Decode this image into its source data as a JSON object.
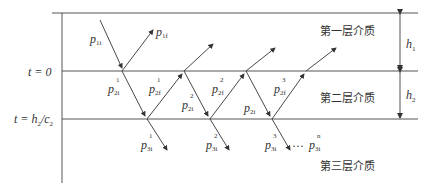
{
  "diagram": {
    "layers": [
      {
        "label": "第一层介质",
        "thickness_label": "h",
        "thickness_sub": "1"
      },
      {
        "label": "第二层介质",
        "thickness_label": "h",
        "thickness_sub": "2"
      },
      {
        "label": "第三层介质"
      }
    ],
    "time_labels": {
      "t0": "t = 0",
      "t1_prefix": "t = h",
      "t1_sub1": "2",
      "t1_mid": "/c",
      "t1_sub2": "2"
    },
    "waves": {
      "p1i": {
        "base": "p",
        "sub": "1i"
      },
      "p1f": {
        "base": "p",
        "sub": "1f"
      },
      "p2i_1": {
        "base": "p",
        "sup": "1",
        "sub": "2i"
      },
      "p2f_1": {
        "base": "p",
        "sup": "1",
        "sub": "2f"
      },
      "p2i_2": {
        "base": "p",
        "sup": "2",
        "sub": "2i"
      },
      "p2f_2": {
        "base": "p",
        "sup": "2",
        "sub": "2f"
      },
      "p2i": {
        "base": "p",
        "sub": "2i"
      },
      "p2f_3": {
        "base": "p",
        "sup": "3",
        "sub": "2f"
      },
      "p3i_1": {
        "base": "p",
        "sup": "1",
        "sub": "3i"
      },
      "p3i_2": {
        "base": "p",
        "sup": "2",
        "sub": "3i"
      },
      "p3i_3": {
        "base": "p",
        "sup": "3",
        "sub": "3i"
      },
      "p3i_n": {
        "base": "p",
        "sup": "n",
        "sub": "3i"
      },
      "ellipsis": "···"
    }
  }
}
